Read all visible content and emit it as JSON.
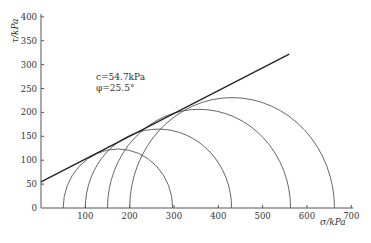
{
  "chart_data": {
    "type": "line",
    "title": "",
    "xlabel": "σ/kPa",
    "ylabel": "τ/kPa",
    "xlim": [
      0,
      700
    ],
    "ylim": [
      0,
      400
    ],
    "xticks": [
      100,
      200,
      300,
      400,
      500,
      600,
      700
    ],
    "yticks": [
      0,
      50,
      100,
      150,
      200,
      250,
      300,
      350,
      400
    ],
    "grid": false,
    "legend": null,
    "annotations": [
      "c=54.7kPa",
      "φ=25.5°"
    ],
    "envelope": {
      "name": "Mohr-Coulomb failure envelope",
      "c_kPa": 54.7,
      "phi_deg": 25.5,
      "x": [
        0,
        560
      ],
      "y": [
        54.7,
        321.8
      ]
    },
    "mohr_circles": [
      {
        "sigma3": 50,
        "sigma1": 297,
        "center": 173.5,
        "radius": 123.5
      },
      {
        "sigma3": 100,
        "sigma1": 430,
        "center": 265,
        "radius": 165
      },
      {
        "sigma3": 150,
        "sigma1": 563,
        "center": 356.5,
        "radius": 206.5
      },
      {
        "sigma3": 200,
        "sigma1": 662,
        "center": 431,
        "radius": 231
      }
    ]
  },
  "labels": {
    "x_axis_title": "σ/kPa",
    "y_axis_title": "τ/kPa",
    "annotation_c": "c=54.7kPa",
    "annotation_phi": "φ=25.5°",
    "x_tick_labels": [
      "100",
      "200",
      "300",
      "400",
      "500",
      "600",
      "700"
    ],
    "y_tick_labels": [
      "0",
      "50",
      "100",
      "150",
      "200",
      "250",
      "300",
      "350",
      "400"
    ]
  },
  "colors": {
    "axis": "#555555",
    "circles": "#555555",
    "envelope": "#222222",
    "text": "#333333"
  }
}
